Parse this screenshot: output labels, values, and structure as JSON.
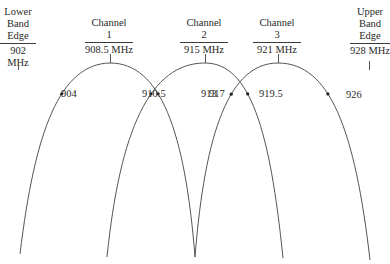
{
  "edges": {
    "lower": {
      "lines": [
        "Lower",
        "Band",
        "Edge"
      ],
      "freq": "902 MHz"
    },
    "upper": {
      "lines": [
        "Upper",
        "Band",
        "Edge"
      ],
      "freq": "928 MHz"
    }
  },
  "channels": [
    {
      "name": "Channel",
      "number": "1",
      "freq": "908.5 MHz",
      "center_mhz": 908.5
    },
    {
      "name": "Channel",
      "number": "2",
      "freq": "915 MHz",
      "center_mhz": 915
    },
    {
      "name": "Channel",
      "number": "3",
      "freq": "921 MHz",
      "center_mhz": 921
    }
  ],
  "points": [
    {
      "label": "904",
      "mhz": 904,
      "channel": 1,
      "side": "left"
    },
    {
      "label": "910.5",
      "mhz": 910.5,
      "channel": 2,
      "side": "left"
    },
    {
      "label": "913",
      "mhz": 913,
      "channel": 1,
      "side": "right"
    },
    {
      "label": "917",
      "mhz": 917,
      "channel": 3,
      "side": "left"
    },
    {
      "label": "919.5",
      "mhz": 919.5,
      "channel": 2,
      "side": "right"
    },
    {
      "label": "926",
      "mhz": 926,
      "channel": 3,
      "side": "right"
    }
  ],
  "colors": {
    "curve": "#555555",
    "text": "#2a2a2a"
  }
}
